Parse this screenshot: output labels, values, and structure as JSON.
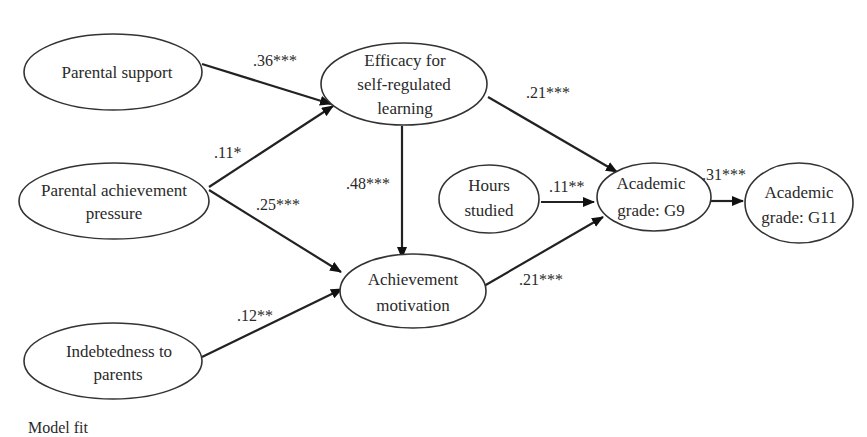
{
  "diagram": {
    "type": "path-model",
    "nodes": [
      {
        "id": "parental_support",
        "lines": [
          "Parental support"
        ]
      },
      {
        "id": "parental_pressure",
        "lines": [
          "Parental achievement",
          "pressure"
        ]
      },
      {
        "id": "indebtedness",
        "lines": [
          "Indebtedness to",
          "parents"
        ]
      },
      {
        "id": "efficacy",
        "lines": [
          "Efficacy for",
          "self-regulated",
          "learning"
        ]
      },
      {
        "id": "achievement_motivation",
        "lines": [
          "Achievement",
          "motivation"
        ]
      },
      {
        "id": "hours_studied",
        "lines": [
          "Hours",
          "studied"
        ]
      },
      {
        "id": "grade_g9",
        "lines": [
          "Academic",
          "grade: G9"
        ]
      },
      {
        "id": "grade_g11",
        "lines": [
          "Academic",
          "grade: G11"
        ]
      }
    ],
    "edges": [
      {
        "from": "parental_support",
        "to": "efficacy",
        "coef": ".36***"
      },
      {
        "from": "parental_pressure",
        "to": "efficacy",
        "coef": ".11*"
      },
      {
        "from": "parental_pressure",
        "to": "achievement_motivation",
        "coef": ".25***"
      },
      {
        "from": "indebtedness",
        "to": "achievement_motivation",
        "coef": ".12**"
      },
      {
        "from": "efficacy",
        "to": "achievement_motivation",
        "coef": ".48***"
      },
      {
        "from": "efficacy",
        "to": "grade_g9",
        "coef": ".21***"
      },
      {
        "from": "hours_studied",
        "to": "grade_g9",
        "coef": ".11**"
      },
      {
        "from": "achievement_motivation",
        "to": "grade_g9",
        "coef": ".21***"
      },
      {
        "from": "grade_g9",
        "to": "grade_g11",
        "coef": ".31***"
      }
    ],
    "footer": "Model fit"
  }
}
